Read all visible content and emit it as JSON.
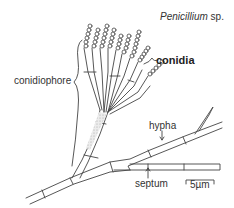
{
  "diagram": {
    "title_italic": "Penicillium",
    "title_suffix": " sp.",
    "labels": {
      "conidia": "conidia",
      "conidiophore": "conidiophore",
      "hypha": "hypha",
      "septum": "septum",
      "scale_bar": "5µm"
    },
    "colors": {
      "stroke": "#444444",
      "fill_cell": "#f4f4f4",
      "fill_stippled": "#dcdcdc",
      "text": "#333333"
    }
  }
}
